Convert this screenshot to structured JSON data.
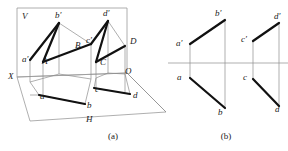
{
  "figure": {
    "colors": {
      "thick_line": "#111111",
      "thin_line": "#8c8c8c",
      "plane_line": "#9a9a9a",
      "text": "#1a1a1a",
      "background": "#ffffff"
    },
    "captions": [
      {
        "key": "a",
        "text": "(a)",
        "x": 113,
        "y": 139
      },
      {
        "key": "b",
        "text": "(b)",
        "x": 226,
        "y": 139
      }
    ]
  },
  "pictorial": {
    "name": "part-a-pictorial-projection",
    "planes": {
      "v_plane_label": "V",
      "h_plane_label": "H",
      "x_axis_label": "X",
      "origin_label": "O",
      "v_plane_points": "17,8 127,8 127,73 17,77",
      "h_plane_points": "17,77 127,73 166,112 30,121"
    },
    "labels": [
      {
        "id": "V",
        "text": "V",
        "x": 22,
        "y": 19,
        "italic": true
      },
      {
        "id": "H",
        "text": "H",
        "x": 86,
        "y": 122,
        "italic": true
      },
      {
        "id": "X",
        "text": "X",
        "x": 8,
        "y": 79,
        "italic": true
      },
      {
        "id": "O",
        "text": "O",
        "x": 125,
        "y": 74,
        "italic": true
      },
      {
        "id": "ap",
        "text": "a′",
        "x": 22,
        "y": 62,
        "italic": true
      },
      {
        "id": "bp",
        "text": "b′",
        "x": 55,
        "y": 18,
        "italic": true
      },
      {
        "id": "cp",
        "text": "c′",
        "x": 86,
        "y": 43,
        "italic": true
      },
      {
        "id": "dp",
        "text": "d′",
        "x": 103,
        "y": 16,
        "italic": true
      },
      {
        "id": "A",
        "text": "A",
        "x": 42,
        "y": 64,
        "italic": true
      },
      {
        "id": "B",
        "text": "B",
        "x": 75,
        "y": 48,
        "italic": true
      },
      {
        "id": "C",
        "text": "C",
        "x": 100,
        "y": 65,
        "italic": true
      },
      {
        "id": "D",
        "text": "D",
        "x": 130,
        "y": 44,
        "italic": true
      },
      {
        "id": "a",
        "text": "a",
        "x": 40,
        "y": 99,
        "italic": true
      },
      {
        "id": "b",
        "text": "b",
        "x": 87,
        "y": 108,
        "italic": true
      },
      {
        "id": "c",
        "text": "c",
        "x": 95,
        "y": 92,
        "italic": true
      },
      {
        "id": "d",
        "text": "d",
        "x": 133,
        "y": 98,
        "italic": true
      }
    ],
    "thick_segments": [
      {
        "id": "AB-space",
        "from": "A",
        "to": "B",
        "x1": 43,
        "y1": 62,
        "x2": 91,
        "y2": 44
      },
      {
        "id": "ap-bp-vproj",
        "from": "a'",
        "to": "b'",
        "x1": 30,
        "y1": 60,
        "x2": 59,
        "y2": 23
      },
      {
        "id": "bp-A-link",
        "from": "b'",
        "to": "A",
        "x1": 59,
        "y1": 23,
        "x2": 43,
        "y2": 62
      },
      {
        "id": "ab-hproj",
        "from": "a",
        "to": "b",
        "x1": 39,
        "y1": 95,
        "x2": 85,
        "y2": 104
      },
      {
        "id": "CD-space",
        "from": "C",
        "to": "D",
        "x1": 96,
        "y1": 62,
        "x2": 125,
        "y2": 46
      },
      {
        "id": "cp-dp-vproj",
        "from": "c'",
        "to": "d'",
        "x1": 91,
        "y1": 44,
        "x2": 108,
        "y2": 21
      },
      {
        "id": "dp-C-link",
        "from": "d'",
        "to": "C",
        "x1": 108,
        "y1": 21,
        "x2": 96,
        "y2": 62
      },
      {
        "id": "cd-hproj",
        "from": "c",
        "to": "d",
        "x1": 94,
        "y1": 88,
        "x2": 130,
        "y2": 94
      }
    ],
    "thin_lines": [
      {
        "id": "a-ap",
        "x1": 30,
        "y1": 60,
        "x2": 30,
        "y2": 82
      },
      {
        "id": "A-a",
        "x1": 43,
        "y1": 62,
        "x2": 43,
        "y2": 95
      },
      {
        "id": "B-b",
        "x1": 91,
        "y1": 44,
        "x2": 91,
        "y2": 79
      },
      {
        "id": "bp-B",
        "x1": 59,
        "y1": 23,
        "x2": 91,
        "y2": 44
      },
      {
        "id": "bp-v",
        "x1": 59,
        "y1": 23,
        "x2": 59,
        "y2": 74
      },
      {
        "id": "C-c",
        "x1": 96,
        "y1": 62,
        "x2": 96,
        "y2": 88
      },
      {
        "id": "D-d",
        "x1": 125,
        "y1": 46,
        "x2": 125,
        "y2": 92
      },
      {
        "id": "dp-D",
        "x1": 108,
        "y1": 21,
        "x2": 125,
        "y2": 46
      },
      {
        "id": "dp-v",
        "x1": 108,
        "y1": 21,
        "x2": 108,
        "y2": 73
      },
      {
        "id": "a-floor",
        "x1": 39,
        "y1": 95,
        "x2": 30,
        "y2": 82
      },
      {
        "id": "b-floor",
        "x1": 85,
        "y1": 104,
        "x2": 91,
        "y2": 79
      },
      {
        "id": "c-floor",
        "x1": 94,
        "y1": 88,
        "x2": 96,
        "y2": 78
      },
      {
        "id": "d-floor",
        "x1": 130,
        "y1": 94,
        "x2": 125,
        "y2": 74
      },
      {
        "id": "a-trace",
        "x1": 39,
        "y1": 95,
        "x2": 30,
        "y2": 95
      },
      {
        "id": "hb-diag",
        "x1": 39,
        "y1": 95,
        "x2": 85,
        "y2": 104
      },
      {
        "id": "quad-a",
        "x1": 30,
        "y1": 82,
        "x2": 59,
        "y2": 74
      },
      {
        "id": "quad-b",
        "x1": 59,
        "y1": 74,
        "x2": 91,
        "y2": 79
      },
      {
        "id": "quad-c",
        "x1": 96,
        "y1": 78,
        "x2": 108,
        "y2": 73
      },
      {
        "id": "quad-d",
        "x1": 108,
        "y1": 73,
        "x2": 125,
        "y2": 74
      },
      {
        "id": "cd-low",
        "x1": 94,
        "y1": 88,
        "x2": 130,
        "y2": 94
      },
      {
        "id": "O-ray",
        "x1": 127,
        "y1": 73,
        "x2": 166,
        "y2": 112
      }
    ]
  },
  "orthographic": {
    "name": "part-b-orthographic-projection",
    "axis": {
      "id": "xo-axis",
      "x1": 168,
      "y1": 63,
      "x2": 288,
      "y2": 63
    },
    "labels": [
      {
        "id": "ap",
        "text": "a′",
        "x": 176,
        "y": 46,
        "italic": true
      },
      {
        "id": "bp",
        "text": "b′",
        "x": 215,
        "y": 16,
        "italic": true
      },
      {
        "id": "cp",
        "text": "c′",
        "x": 241,
        "y": 42,
        "italic": true
      },
      {
        "id": "dp",
        "text": "d′",
        "x": 274,
        "y": 19,
        "italic": true
      },
      {
        "id": "a",
        "text": "a",
        "x": 177,
        "y": 80,
        "italic": true
      },
      {
        "id": "b",
        "text": "b",
        "x": 218,
        "y": 115,
        "italic": true
      },
      {
        "id": "c",
        "text": "c",
        "x": 243,
        "y": 80,
        "italic": true
      },
      {
        "id": "d",
        "text": "d",
        "x": 275,
        "y": 112,
        "italic": true
      }
    ],
    "thick_segments": [
      {
        "id": "ap-bp",
        "from": "a'",
        "to": "b'",
        "x1": 190,
        "y1": 44,
        "x2": 225,
        "y2": 20
      },
      {
        "id": "a-b",
        "from": "a",
        "to": "b",
        "x1": 190,
        "y1": 78,
        "x2": 225,
        "y2": 108
      },
      {
        "id": "cp-dp",
        "from": "c'",
        "to": "d'",
        "x1": 253,
        "y1": 41,
        "x2": 279,
        "y2": 23
      },
      {
        "id": "c-d",
        "from": "c",
        "to": "d",
        "x1": 253,
        "y1": 79,
        "x2": 279,
        "y2": 106
      }
    ],
    "thin_lines": [
      {
        "id": "a-vertical",
        "x1": 190,
        "y1": 44,
        "x2": 190,
        "y2": 78
      },
      {
        "id": "b-vertical",
        "x1": 225,
        "y1": 20,
        "x2": 225,
        "y2": 108
      },
      {
        "id": "c-vertical",
        "x1": 253,
        "y1": 41,
        "x2": 253,
        "y2": 79
      },
      {
        "id": "d-vertical",
        "x1": 279,
        "y1": 23,
        "x2": 279,
        "y2": 106
      }
    ]
  }
}
